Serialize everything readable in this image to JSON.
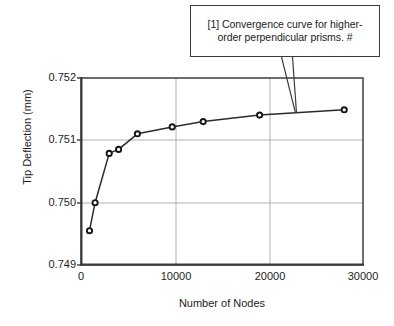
{
  "callout": {
    "line1": "[1] Convergence curve for higher-",
    "line2": "order perpendicular prisms. #",
    "full_text": "[1] Convergence curve for higher-order perpendicular prisms. #",
    "border_color": "#3b3b3b",
    "background_color": "#ffffff"
  },
  "chart_data": {
    "type": "line",
    "title": "",
    "xlabel": "Number of Nodes",
    "ylabel": "Tip Deflection (mm)",
    "xlim": [
      0,
      30000
    ],
    "ylim": [
      0.749,
      0.752
    ],
    "xticks": [
      "0",
      "10000",
      "20000",
      "30000"
    ],
    "xtick_values": [
      0,
      10000,
      20000,
      30000
    ],
    "yticks": [
      "0.749",
      "0.750",
      "0.751",
      "0.752"
    ],
    "ytick_values": [
      0.749,
      0.75,
      0.751,
      0.752
    ],
    "grid": true,
    "grid_color": "#a8a8a8",
    "frame_color": "#4a4a4a",
    "legend": null,
    "legend_position": "none",
    "series": [
      {
        "name": "Tip Deflection",
        "marker": "circle-open",
        "line_color": "#2b2b2b",
        "marker_face_color": "#ffffff",
        "marker_edge_color": "#1a1a1a",
        "x": [
          900,
          1500,
          3000,
          4000,
          6000,
          9700,
          13000,
          19000,
          28000
        ],
        "y": [
          0.74955,
          0.75,
          0.75079,
          0.750855,
          0.751105,
          0.751215,
          0.7513,
          0.751405,
          0.75149
        ]
      }
    ],
    "annotations": [
      {
        "text": "[1] Convergence curve for higher-order perpendicular prisms. #",
        "target_x": 22200,
        "target_y": 0.75147,
        "kind": "callout-box-with-v-pointer"
      }
    ]
  }
}
